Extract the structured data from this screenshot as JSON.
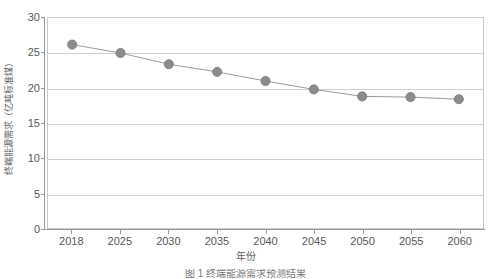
{
  "chart_data": {
    "type": "line",
    "title": "",
    "xlabel": "年份",
    "ylabel": "终端能源需求（亿吨标准煤）",
    "categories": [
      "2018",
      "2025",
      "2030",
      "2035",
      "2040",
      "2045",
      "2050",
      "2055",
      "2060"
    ],
    "values": [
      26.2,
      25.0,
      23.4,
      22.3,
      21.0,
      19.8,
      18.8,
      18.7,
      18.4
    ],
    "series": [
      {
        "name": "终端能源需求",
        "values": [
          26.2,
          25.0,
          23.4,
          22.3,
          21.0,
          19.8,
          18.8,
          18.7,
          18.4
        ]
      }
    ],
    "ylim": [
      0,
      30
    ],
    "yticks": [
      0,
      5,
      10,
      15,
      20,
      25,
      30
    ],
    "ytick_labels": [
      "0",
      "5",
      "10",
      "15",
      "20",
      "25",
      "30"
    ],
    "grid": "horizontal",
    "legend": "none",
    "marker": "circle",
    "colors": {
      "marker_fill": "#8c8c8c",
      "marker_stroke": "#7a7a7a",
      "line": "#9a9a9a",
      "gridline": "#cfcfcf",
      "axis": "#9a9a9a",
      "plot_border": "#c9c9c9",
      "text": "#585858",
      "background": "#ffffff"
    }
  },
  "caption": {
    "text": "图 1  终端能源需求预测结果"
  }
}
